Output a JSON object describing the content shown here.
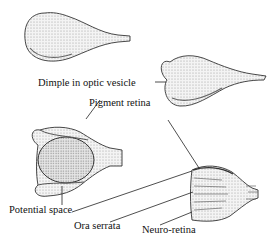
{
  "figure": {
    "type": "anatomical-illustration"
  },
  "labels": {
    "dimple": "Dimple in optic vesicle",
    "pigment_retina": "Pigment retina",
    "potential_space": "Potential space",
    "ora_serrata": "Ora serrata",
    "neuro_retina": "Neuro-retina"
  },
  "stages": [
    {
      "id": 1,
      "name": "optic-vesicle"
    },
    {
      "id": 2,
      "name": "dimpled-optic-vesicle"
    },
    {
      "id": 3,
      "name": "optic-cup"
    },
    {
      "id": 4,
      "name": "retina-section"
    }
  ],
  "colors": {
    "ink": "#222222",
    "shade": "#bdbdbd",
    "background": "#ffffff"
  }
}
